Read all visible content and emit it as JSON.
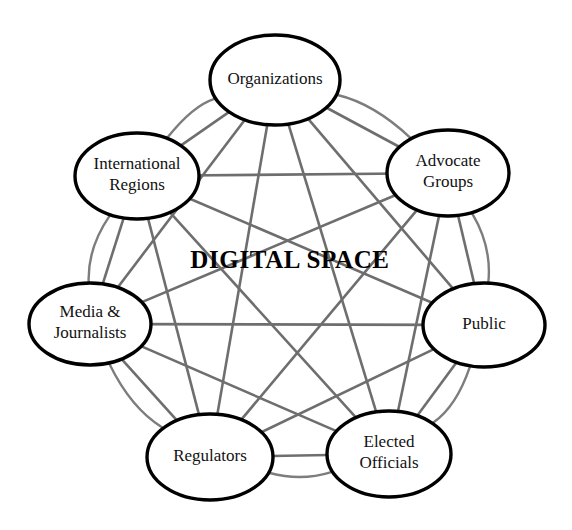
{
  "diagram": {
    "title": "DIGITAL SPACE",
    "center_label": "DIGITAL SPACE",
    "type": "network",
    "canvas": {
      "width": 572,
      "height": 530,
      "background": "#ffffff"
    },
    "style": {
      "node_fill": "#ffffff",
      "node_stroke": "#000000",
      "node_stroke_width": 3.4,
      "link_color": "#6e6e6e",
      "link_width": 2.6,
      "ring_arc_color": "#7d7d7d",
      "ring_arc_width": 2.4,
      "label_color": "#111111",
      "center_label_color": "#000000"
    },
    "nodes": [
      {
        "id": "organizations",
        "label": "Organizations",
        "lines": [
          "Organizations"
        ],
        "cx": 275,
        "cy": 80,
        "rx": 65,
        "ry": 45
      },
      {
        "id": "advocate-groups",
        "label": "Advocate Groups",
        "lines": [
          "Advocate",
          "Groups"
        ],
        "cx": 448,
        "cy": 173,
        "rx": 61,
        "ry": 43
      },
      {
        "id": "public",
        "label": "Public",
        "lines": [
          "Public"
        ],
        "cx": 484,
        "cy": 325,
        "rx": 61,
        "ry": 42
      },
      {
        "id": "elected-officials",
        "label": "Elected Officials",
        "lines": [
          "Elected",
          "Officials"
        ],
        "cx": 389,
        "cy": 454,
        "rx": 62,
        "ry": 43
      },
      {
        "id": "regulators",
        "label": "Regulators",
        "lines": [
          "Regulators"
        ],
        "cx": 210,
        "cy": 457,
        "rx": 63,
        "ry": 43
      },
      {
        "id": "media-journalists",
        "label": "Media & Journalists",
        "lines": [
          "Media &",
          "Journalists"
        ],
        "cx": 90,
        "cy": 324,
        "rx": 61,
        "ry": 41
      },
      {
        "id": "international-regions",
        "label": "International Regions",
        "lines": [
          "International",
          "Regions"
        ],
        "cx": 137,
        "cy": 176,
        "rx": 62,
        "ry": 43
      }
    ],
    "ring_connections": [
      {
        "from": "international-regions",
        "to": "organizations"
      },
      {
        "from": "organizations",
        "to": "advocate-groups"
      },
      {
        "from": "advocate-groups",
        "to": "public"
      },
      {
        "from": "public",
        "to": "elected-officials"
      },
      {
        "from": "elected-officials",
        "to": "regulators"
      },
      {
        "from": "regulators",
        "to": "media-journalists"
      },
      {
        "from": "media-journalists",
        "to": "international-regions"
      }
    ],
    "links": [
      {
        "from": "organizations",
        "to": "advocate-groups",
        "bidirectional": true
      },
      {
        "from": "organizations",
        "to": "public",
        "bidirectional": true
      },
      {
        "from": "organizations",
        "to": "elected-officials",
        "bidirectional": true
      },
      {
        "from": "organizations",
        "to": "regulators",
        "bidirectional": true
      },
      {
        "from": "organizations",
        "to": "media-journalists",
        "bidirectional": true
      },
      {
        "from": "organizations",
        "to": "international-regions",
        "bidirectional": true
      },
      {
        "from": "advocate-groups",
        "to": "public",
        "bidirectional": true
      },
      {
        "from": "advocate-groups",
        "to": "elected-officials",
        "bidirectional": true
      },
      {
        "from": "advocate-groups",
        "to": "regulators",
        "bidirectional": true
      },
      {
        "from": "advocate-groups",
        "to": "media-journalists",
        "bidirectional": true
      },
      {
        "from": "advocate-groups",
        "to": "international-regions",
        "bidirectional": true
      },
      {
        "from": "public",
        "to": "elected-officials",
        "bidirectional": true
      },
      {
        "from": "public",
        "to": "regulators",
        "bidirectional": true
      },
      {
        "from": "public",
        "to": "media-journalists",
        "bidirectional": true
      },
      {
        "from": "public",
        "to": "international-regions",
        "bidirectional": true
      },
      {
        "from": "elected-officials",
        "to": "regulators",
        "bidirectional": true
      },
      {
        "from": "elected-officials",
        "to": "media-journalists",
        "bidirectional": true
      },
      {
        "from": "elected-officials",
        "to": "international-regions",
        "bidirectional": true
      },
      {
        "from": "regulators",
        "to": "media-journalists",
        "bidirectional": true
      },
      {
        "from": "regulators",
        "to": "international-regions",
        "bidirectional": true
      },
      {
        "from": "media-journalists",
        "to": "international-regions",
        "bidirectional": true
      }
    ]
  }
}
